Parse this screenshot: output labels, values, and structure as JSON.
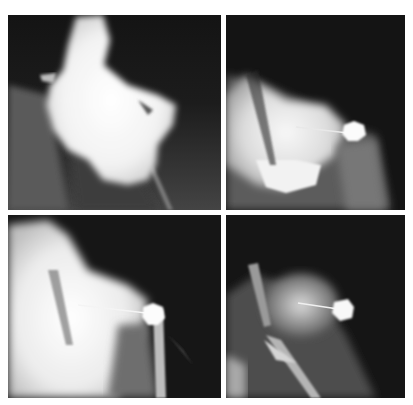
{
  "figure": {
    "layout": "2x2 grid of grayscale radiograph panels",
    "background_color": "#ffffff",
    "panels": [
      {
        "position": "top-left",
        "label": "Radiograph panel 1 - contrast-filled bright mass, no marker"
      },
      {
        "position": "top-right",
        "label": "Radiograph panel 2 - bright mass with pin-head marker"
      },
      {
        "position": "bottom-left",
        "label": "Radiograph panel 3 - bright mass with pin-head marker"
      },
      {
        "position": "bottom-right",
        "label": "Radiograph panel 4 - pin-head marker with tubular structures"
      }
    ],
    "colors": {
      "panel_dark": "#151515",
      "bright": "#f4f4f4",
      "mid_gray": "#7a7a7a"
    }
  }
}
